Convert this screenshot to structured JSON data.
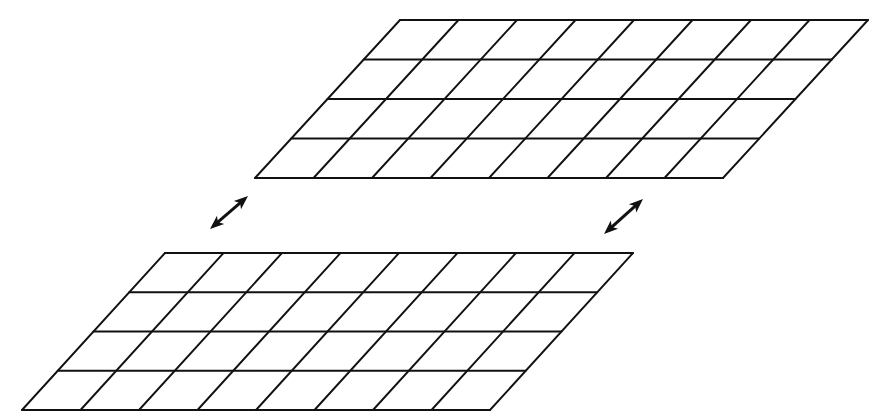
{
  "figure": {
    "background_color": "#ffffff",
    "stroke_color": "#111111",
    "canvas": {
      "width": 875,
      "height": 414
    }
  },
  "planes": [
    {
      "name": "upper-plane",
      "label": "Upper grid plane",
      "columns": 8,
      "rows": 4,
      "origin_x": 400,
      "origin_y": 20,
      "width": 468,
      "height": 158,
      "shear_x": -145,
      "stroke_width": 1.9,
      "stroke_color": "#111111"
    },
    {
      "name": "lower-plane",
      "label": "Lower grid plane",
      "columns": 8,
      "rows": 4,
      "origin_x": 165,
      "origin_y": 253,
      "width": 468,
      "height": 157,
      "shear_x": -143,
      "stroke_width": 1.9,
      "stroke_color": "#111111"
    }
  ],
  "connectors": [
    {
      "name": "left-connector-arrow",
      "label": "Left double-headed arrow",
      "x1": 210,
      "y1": 229,
      "x2": 248,
      "y2": 196,
      "shaft_width": 3.0,
      "head_length": 14,
      "head_width": 11,
      "color": "#111111",
      "double_headed": true
    },
    {
      "name": "right-connector-arrow",
      "label": "Right double-headed arrow",
      "x1": 604,
      "y1": 234,
      "x2": 643,
      "y2": 199,
      "shaft_width": 3.0,
      "head_length": 14,
      "head_width": 11,
      "color": "#111111",
      "double_headed": true
    }
  ],
  "chart_data": {
    "type": "diagram",
    "elements": [
      {
        "id": "upper-plane",
        "kind": "grid-parallelogram",
        "columns": 8,
        "rows": 4,
        "cells": 32
      },
      {
        "id": "lower-plane",
        "kind": "grid-parallelogram",
        "columns": 8,
        "rows": 4,
        "cells": 32
      },
      {
        "id": "left-connector-arrow",
        "kind": "double-arrow"
      },
      {
        "id": "right-connector-arrow",
        "kind": "double-arrow"
      }
    ]
  }
}
